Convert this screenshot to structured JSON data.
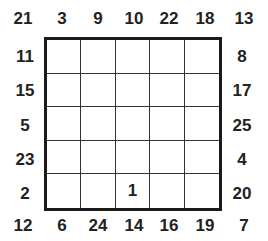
{
  "puzzle": {
    "corners": {
      "top_left": "21",
      "top_right": "13",
      "bottom_left": "12",
      "bottom_right": "7"
    },
    "top_clues": [
      "3",
      "9",
      "10",
      "22",
      "18"
    ],
    "bottom_clues": [
      "6",
      "24",
      "14",
      "16",
      "19"
    ],
    "left_clues": [
      "11",
      "15",
      "5",
      "23",
      "2"
    ],
    "right_clues": [
      "8",
      "17",
      "25",
      "4",
      "20"
    ],
    "grid": [
      [
        "",
        "",
        "",
        "",
        ""
      ],
      [
        "",
        "",
        "",
        "",
        ""
      ],
      [
        "",
        "",
        "",
        "",
        ""
      ],
      [
        "",
        "",
        "",
        "",
        ""
      ],
      [
        "",
        "",
        "1",
        "",
        ""
      ]
    ]
  }
}
